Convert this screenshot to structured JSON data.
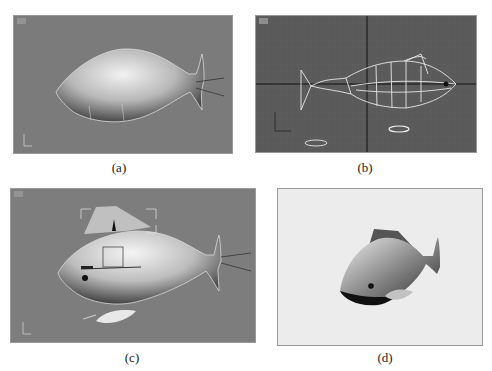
{
  "figure": {
    "panels": [
      {
        "id": "a",
        "caption": "(a)",
        "view": "shaded viewport",
        "background": "#7b7b7b"
      },
      {
        "id": "b",
        "caption": "(b)",
        "view": "wireframe viewport with grid",
        "background": "#5a5a5a"
      },
      {
        "id": "c",
        "caption": "(c)",
        "view": "shaded viewport with fins and gizmo",
        "background": "#7d7d7d"
      },
      {
        "id": "d",
        "caption": "(d)",
        "view": "final render",
        "background": "#ececec"
      }
    ]
  }
}
